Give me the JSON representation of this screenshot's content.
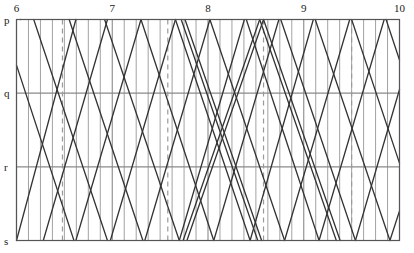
{
  "chart_data": {
    "type": "line",
    "title": "",
    "subtitle": "",
    "xlabel": "",
    "ylabel": "",
    "grid": true,
    "legend": "none",
    "xlim": [
      6,
      10
    ],
    "ylim": [
      0,
      3
    ],
    "x_ticks": [
      {
        "value": 6,
        "label": "6"
      },
      {
        "value": 7,
        "label": "7"
      },
      {
        "value": 8,
        "label": "8"
      },
      {
        "value": 9,
        "label": "9"
      },
      {
        "value": 10,
        "label": "10"
      }
    ],
    "y_ticks": [
      {
        "value": 0,
        "label": "p"
      },
      {
        "value": 1,
        "label": "q"
      },
      {
        "value": 2,
        "label": "r"
      },
      {
        "value": 3,
        "label": "s"
      }
    ],
    "minor_x_gridlines": [
      6.125,
      6.25,
      6.375,
      6.5,
      6.625,
      6.75,
      6.875,
      7.125,
      7.25,
      7.375,
      7.5,
      7.625,
      7.75,
      7.875,
      8.125,
      8.25,
      8.375,
      8.5,
      8.625,
      8.75,
      8.875,
      9.125,
      9.25,
      9.375,
      9.5,
      9.625,
      9.75,
      9.875
    ],
    "dashed_x_gridlines": [
      6.48,
      7.58,
      8.58,
      9.5
    ],
    "series": [
      {
        "name": "down-1",
        "points": [
          [
            6.0,
            0.62
          ],
          [
            6.6,
            3.0
          ]
        ]
      },
      {
        "name": "up-1",
        "points": [
          [
            6.0,
            3.0
          ],
          [
            6.62,
            0.0
          ]
        ]
      },
      {
        "name": "down-2",
        "points": [
          [
            6.18,
            0.0
          ],
          [
            6.95,
            3.0
          ]
        ]
      },
      {
        "name": "up-2",
        "points": [
          [
            6.28,
            3.0
          ],
          [
            6.95,
            0.0
          ]
        ]
      },
      {
        "name": "down-3",
        "points": [
          [
            6.55,
            0.0
          ],
          [
            7.32,
            3.0
          ]
        ]
      },
      {
        "name": "up-3",
        "points": [
          [
            6.62,
            3.0
          ],
          [
            7.3,
            0.0
          ]
        ]
      },
      {
        "name": "down-4",
        "points": [
          [
            6.92,
            0.0
          ],
          [
            7.7,
            3.0
          ]
        ]
      },
      {
        "name": "up-4",
        "points": [
          [
            6.98,
            3.0
          ],
          [
            7.66,
            0.0
          ]
        ]
      },
      {
        "name": "down-5",
        "points": [
          [
            7.3,
            0.0
          ],
          [
            8.06,
            3.0
          ]
        ]
      },
      {
        "name": "up-5",
        "points": [
          [
            7.34,
            3.0
          ],
          [
            8.02,
            0.0
          ]
        ]
      },
      {
        "name": "down-6",
        "points": [
          [
            7.66,
            0.0
          ],
          [
            8.44,
            3.0
          ]
        ]
      },
      {
        "name": "up-6",
        "points": [
          [
            7.7,
            3.0
          ],
          [
            8.38,
            0.0
          ]
        ]
      },
      {
        "name": "down-7",
        "points": [
          [
            8.02,
            0.0
          ],
          [
            8.8,
            3.0
          ]
        ]
      },
      {
        "name": "up-7",
        "points": [
          [
            8.06,
            3.0
          ],
          [
            8.74,
            0.0
          ]
        ]
      },
      {
        "name": "down-8",
        "points": [
          [
            8.4,
            0.0
          ],
          [
            9.16,
            3.0
          ]
        ]
      },
      {
        "name": "up-8",
        "points": [
          [
            8.44,
            3.0
          ],
          [
            9.1,
            0.0
          ]
        ]
      },
      {
        "name": "down-9",
        "points": [
          [
            8.76,
            0.0
          ],
          [
            9.54,
            3.0
          ]
        ]
      },
      {
        "name": "up-9",
        "points": [
          [
            8.8,
            3.0
          ],
          [
            9.48,
            0.0
          ]
        ]
      },
      {
        "name": "down-10",
        "points": [
          [
            9.12,
            0.0
          ],
          [
            9.9,
            3.0
          ]
        ]
      },
      {
        "name": "up-10",
        "points": [
          [
            9.16,
            3.0
          ],
          [
            9.84,
            0.0
          ]
        ]
      },
      {
        "name": "down-11",
        "points": [
          [
            9.5,
            0.0
          ],
          [
            10.0,
            1.95
          ]
        ]
      },
      {
        "name": "up-11",
        "points": [
          [
            9.54,
            3.0
          ],
          [
            10.0,
            0.95
          ]
        ]
      },
      {
        "name": "down-12",
        "points": [
          [
            9.86,
            0.0
          ],
          [
            10.0,
            0.55
          ]
        ]
      },
      {
        "name": "up-12",
        "points": [
          [
            9.9,
            3.0
          ],
          [
            10.0,
            2.6
          ]
        ]
      },
      {
        "name": "express-down-a",
        "points": [
          [
            7.72,
            0.0
          ],
          [
            8.52,
            3.0
          ]
        ]
      },
      {
        "name": "express-down-b",
        "points": [
          [
            7.76,
            0.0
          ],
          [
            8.56,
            3.0
          ]
        ]
      },
      {
        "name": "express-up-a",
        "points": [
          [
            7.74,
            3.0
          ],
          [
            8.54,
            0.0
          ]
        ]
      },
      {
        "name": "express-up-b",
        "points": [
          [
            7.78,
            3.0
          ],
          [
            8.58,
            0.0
          ]
        ]
      },
      {
        "name": "express-down-c",
        "points": [
          [
            8.54,
            0.0
          ],
          [
            9.34,
            3.0
          ]
        ]
      },
      {
        "name": "express-down-d",
        "points": [
          [
            8.58,
            0.0
          ],
          [
            9.38,
            3.0
          ]
        ]
      },
      {
        "name": "long-up-a",
        "points": [
          [
            6.04,
            0.0
          ],
          [
            6.04,
            0.0
          ]
        ]
      }
    ],
    "lines_color": "#333333",
    "grid_color": "#8a8a8a",
    "dash_color": "#9a9a9a",
    "frame_color": "#555555"
  },
  "axes": {
    "top_axis_name": "time-axis",
    "left_axis_name": "station-axis"
  }
}
